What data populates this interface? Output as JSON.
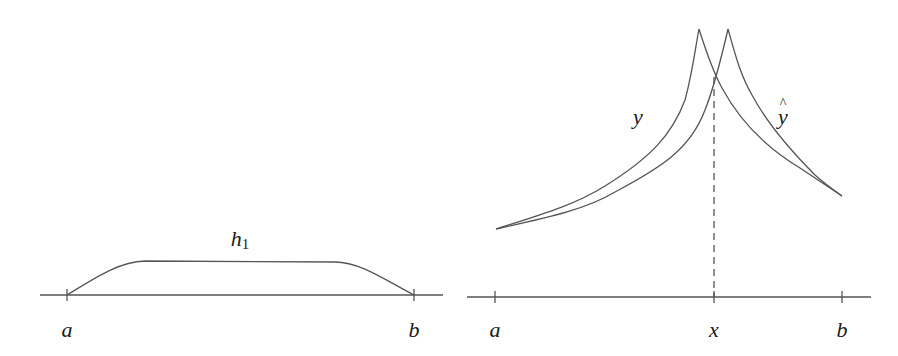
{
  "figure": {
    "stroke_color": "#555555",
    "label_color": "#1a1a1a",
    "background": "#ffffff"
  },
  "left_panel": {
    "curve_label": "h",
    "curve_label_subscript": "1",
    "axis_ticks": [
      {
        "label": "a",
        "x": 67
      },
      {
        "label": "b",
        "x": 414
      }
    ]
  },
  "right_panel": {
    "curve_labels": {
      "y": "y",
      "y_hat": "y"
    },
    "axis_ticks": [
      {
        "label": "a",
        "x": 495
      },
      {
        "label": "x",
        "x": 714
      },
      {
        "label": "b",
        "x": 842
      }
    ],
    "dashed_line_at": "x"
  }
}
